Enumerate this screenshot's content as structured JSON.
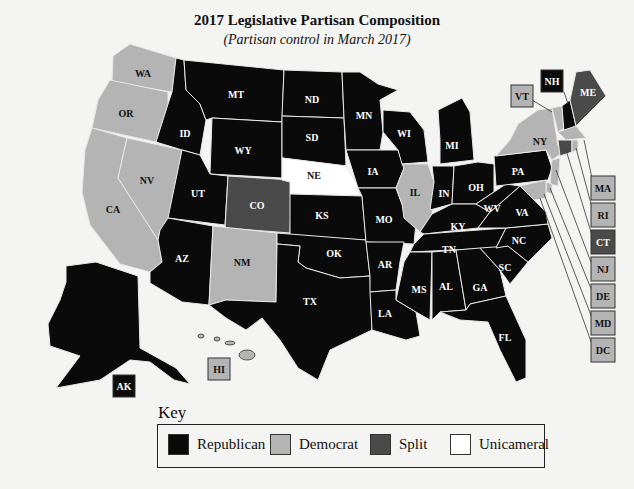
{
  "title": "2017 Legislative Partisan Composition",
  "subtitle": "(Partisan control in March 2017)",
  "colors": {
    "republican": "#0a0a0a",
    "democrat": "#b4b4b4",
    "split": "#4a4a4a",
    "unicameral": "#ffffff"
  },
  "key": {
    "title": "Key",
    "items": [
      {
        "label": "Republican",
        "color": "#0a0a0a"
      },
      {
        "label": "Democrat",
        "color": "#b4b4b4"
      },
      {
        "label": "Split",
        "color": "#4a4a4a"
      },
      {
        "label": "Unicameral",
        "color": "#ffffff"
      }
    ]
  },
  "states": {
    "WA": "Democrat",
    "OR": "Democrat",
    "CA": "Democrat",
    "NV": "Democrat",
    "ID": "Republican",
    "MT": "Republican",
    "WY": "Republican",
    "UT": "Republican",
    "CO": "Split",
    "AZ": "Republican",
    "NM": "Democrat",
    "ND": "Republican",
    "SD": "Republican",
    "NE": "Unicameral",
    "KS": "Republican",
    "OK": "Republican",
    "TX": "Republican",
    "MN": "Republican",
    "IA": "Republican",
    "MO": "Republican",
    "AR": "Republican",
    "LA": "Republican",
    "WI": "Republican",
    "IL": "Democrat",
    "MI": "Republican",
    "IN": "Republican",
    "OH": "Republican",
    "KY": "Republican",
    "TN": "Republican",
    "MS": "Republican",
    "AL": "Republican",
    "GA": "Republican",
    "FL": "Republican",
    "SC": "Republican",
    "NC": "Republican",
    "VA": "Republican",
    "WV": "Republican",
    "PA": "Republican",
    "NY": "Democrat",
    "VT": "Democrat",
    "NH": "Republican",
    "ME": "Split",
    "MA": "Democrat",
    "RI": "Democrat",
    "CT": "Split",
    "NJ": "Democrat",
    "DE": "Democrat",
    "MD": "Democrat",
    "DC": "Democrat",
    "AK": "Republican",
    "HI": "Democrat"
  },
  "labels": {
    "WA": "WA",
    "OR": "OR",
    "CA": "CA",
    "NV": "NV",
    "ID": "ID",
    "MT": "MT",
    "WY": "WY",
    "UT": "UT",
    "CO": "CO",
    "AZ": "AZ",
    "NM": "NM",
    "ND": "ND",
    "SD": "SD",
    "NE": "NE",
    "KS": "KS",
    "OK": "OK",
    "TX": "TX",
    "MN": "MN",
    "IA": "IA",
    "MO": "MO",
    "AR": "AR",
    "LA": "LA",
    "WI": "WI",
    "IL": "IL",
    "MI": "MI",
    "IN": "IN",
    "OH": "OH",
    "KY": "KY",
    "TN": "TN",
    "MS": "MS",
    "AL": "AL",
    "GA": "GA",
    "FL": "FL",
    "SC": "SC",
    "NC": "NC",
    "VA": "VA",
    "WV": "WV",
    "PA": "PA",
    "NY": "NY",
    "VT": "VT",
    "NH": "NH",
    "ME": "ME",
    "MA": "MA",
    "RI": "RI",
    "CT": "CT",
    "NJ": "NJ",
    "DE": "DE",
    "MD": "MD",
    "DC": "DC",
    "AK": "AK",
    "HI": "HI"
  }
}
